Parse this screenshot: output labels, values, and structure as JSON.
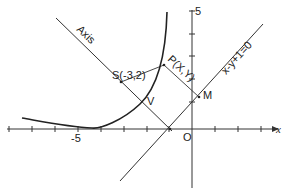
{
  "diagram": {
    "type": "parabola-focus-directrix",
    "labels": {
      "axis": "Axis",
      "focus": "S(-3,2)",
      "point": "P(X,Y)",
      "directrix_eq": "x-y+1=0",
      "foot": "M",
      "vertex": "V",
      "origin": "O",
      "x_axis": "x",
      "x_tick": "-5",
      "y_tick": "5"
    },
    "colors": {
      "ink": "#222222",
      "background": "#ffffff"
    }
  }
}
